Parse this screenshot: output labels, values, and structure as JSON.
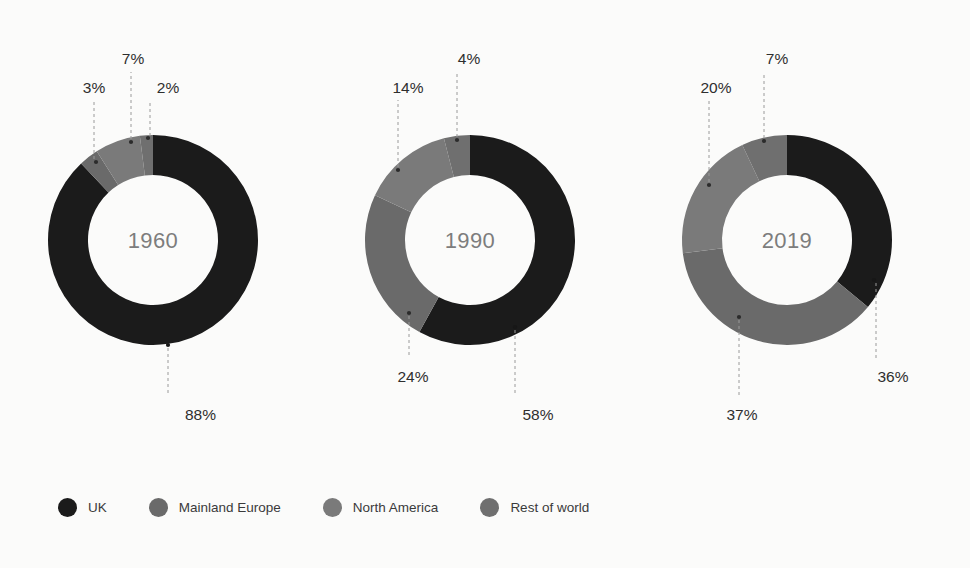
{
  "background": "#fbfbfa",
  "legend": {
    "position": "bottom-left",
    "items": [
      {
        "label": "UK",
        "color": "#1b1b1b"
      },
      {
        "label": "Mainland Europe",
        "color": "#6a6a6a"
      },
      {
        "label": "North America",
        "color": "#7a7a7a"
      },
      {
        "label": "Rest of world",
        "color": "#6f6f6f"
      }
    ]
  },
  "chart_data": {
    "type": "pie",
    "title": "",
    "subtitle": "",
    "xlabel": "",
    "ylabel": "",
    "grid": false,
    "legend_position": "bottom-left",
    "value_suffix": "%",
    "categories": [
      "UK",
      "Mainland Europe",
      "North America",
      "Rest of world"
    ],
    "colors": [
      "#1b1b1b",
      "#6a6a6a",
      "#7a7a7a",
      "#6f6f6f"
    ],
    "charts": [
      {
        "name": "1960",
        "center_label": "1960",
        "values": [
          88,
          3,
          7,
          2
        ],
        "labels": [
          "88%",
          "3%",
          "7%",
          "2%"
        ]
      },
      {
        "name": "1990",
        "center_label": "1990",
        "values": [
          58,
          24,
          14,
          4
        ],
        "labels": [
          "58%",
          "24%",
          "14%",
          "4%"
        ]
      },
      {
        "name": "2019",
        "center_label": "2019",
        "values": [
          36,
          37,
          20,
          7
        ],
        "labels": [
          "36%",
          "37%",
          "20%",
          "7%"
        ]
      }
    ]
  },
  "donuts": [
    {
      "id": "donut-1960",
      "center_label": "1960",
      "cx": 153,
      "cy": 240,
      "r_outer": 105,
      "r_inner": 65,
      "center_label_x": 153,
      "center_label_y": 248,
      "slices": [
        {
          "category": "UK",
          "value": 88,
          "label": "88%",
          "color": "#1b1b1b",
          "start": 0,
          "end": 316.8,
          "dot_x": 168,
          "dot_y": 345,
          "dot_dark": true,
          "line": "M 168,348 L 168,396",
          "label_x": 216,
          "label_y": 420,
          "label_anchor": "end"
        },
        {
          "category": "Mainland Europe",
          "value": 3,
          "label": "3%",
          "color": "#6a6a6a",
          "start": 316.8,
          "end": 327.6,
          "dot_x": 96,
          "dot_y": 162,
          "dot_dark": false,
          "line": "M 94,159 L 94,100",
          "label_x": 94,
          "label_y": 93,
          "label_anchor": "middle"
        },
        {
          "category": "North America",
          "value": 7,
          "label": "7%",
          "color": "#7a7a7a",
          "start": 327.6,
          "end": 352.8,
          "dot_x": 131,
          "dot_y": 142,
          "dot_dark": false,
          "line": "M 131,139 L 131,72",
          "label_x": 133,
          "label_y": 64,
          "label_anchor": "middle"
        },
        {
          "category": "Rest of world",
          "value": 2,
          "label": "2%",
          "color": "#6f6f6f",
          "start": 352.8,
          "end": 360,
          "dot_x": 148,
          "dot_y": 138,
          "dot_dark": false,
          "line": "M 150,136 L 150,100",
          "label_x": 168,
          "label_y": 93,
          "label_anchor": "middle"
        }
      ]
    },
    {
      "id": "donut-1990",
      "center_label": "1990",
      "cx": 470,
      "cy": 240,
      "r_outer": 105,
      "r_inner": 65,
      "center_label_x": 470,
      "center_label_y": 248,
      "slices": [
        {
          "category": "UK",
          "value": 58,
          "label": "58%",
          "color": "#1b1b1b",
          "start": 0,
          "end": 208.8,
          "dot_x": 515,
          "dot_y": 327,
          "dot_dark": true,
          "line": "M 515,330 L 515,396",
          "label_x": 538,
          "label_y": 420,
          "label_anchor": "middle"
        },
        {
          "category": "Mainland Europe",
          "value": 24,
          "label": "24%",
          "color": "#6a6a6a",
          "start": 208.8,
          "end": 295.2,
          "dot_x": 409,
          "dot_y": 313,
          "dot_dark": false,
          "line": "M 409,316 L 409,358",
          "label_x": 413,
          "label_y": 382,
          "label_anchor": "middle"
        },
        {
          "category": "North America",
          "value": 14,
          "label": "14%",
          "color": "#7a7a7a",
          "start": 295.2,
          "end": 345.6,
          "dot_x": 398,
          "dot_y": 170,
          "dot_dark": false,
          "line": "M 398,167 L 398,100",
          "label_x": 408,
          "label_y": 93,
          "label_anchor": "middle"
        },
        {
          "category": "Rest of world",
          "value": 4,
          "label": "4%",
          "color": "#6f6f6f",
          "start": 345.6,
          "end": 360,
          "dot_x": 457,
          "dot_y": 140,
          "dot_dark": false,
          "line": "M 457,137 L 457,72",
          "label_x": 469,
          "label_y": 64,
          "label_anchor": "middle"
        }
      ]
    },
    {
      "id": "donut-2019",
      "center_label": "2019",
      "cx": 787,
      "cy": 240,
      "r_outer": 105,
      "r_inner": 65,
      "center_label_x": 787,
      "center_label_y": 248,
      "slices": [
        {
          "category": "UK",
          "value": 36,
          "label": "36%",
          "color": "#1b1b1b",
          "start": 0,
          "end": 129.6,
          "dot_x": 874,
          "dot_y": 280,
          "dot_dark": true,
          "line": "M 876,283 L 876,358",
          "label_x": 893,
          "label_y": 382,
          "label_anchor": "middle"
        },
        {
          "category": "Mainland Europe",
          "value": 37,
          "label": "37%",
          "color": "#6a6a6a",
          "start": 129.6,
          "end": 262.8,
          "dot_x": 739,
          "dot_y": 317,
          "dot_dark": false,
          "line": "M 739,320 L 739,396",
          "label_x": 742,
          "label_y": 420,
          "label_anchor": "middle"
        },
        {
          "category": "North America",
          "value": 20,
          "label": "20%",
          "color": "#7a7a7a",
          "start": 262.8,
          "end": 334.8,
          "dot_x": 709,
          "dot_y": 185,
          "dot_dark": false,
          "line": "M 709,182 L 709,100",
          "label_x": 716,
          "label_y": 93,
          "label_anchor": "middle"
        },
        {
          "category": "Rest of world",
          "value": 7,
          "label": "7%",
          "color": "#6f6f6f",
          "start": 334.8,
          "end": 360,
          "dot_x": 764,
          "dot_y": 141,
          "dot_dark": false,
          "line": "M 764,138 L 764,72",
          "label_x": 777,
          "label_y": 64,
          "label_anchor": "middle"
        }
      ]
    }
  ]
}
